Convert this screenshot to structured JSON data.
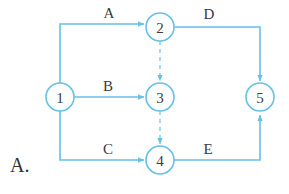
{
  "figure": {
    "caption": "A.",
    "colors": {
      "edge": "#66c0e8",
      "node_stroke": "#66c0e8",
      "node_fill": "#ffffff",
      "text": "#3a3a3a",
      "background": "#ffffff"
    }
  },
  "nodes": [
    {
      "id": "1",
      "label": "1",
      "cx": 60,
      "cy": 97,
      "r": 14
    },
    {
      "id": "2",
      "label": "2",
      "cx": 160,
      "cy": 27,
      "r": 14
    },
    {
      "id": "3",
      "label": "3",
      "cx": 160,
      "cy": 97,
      "r": 14
    },
    {
      "id": "4",
      "label": "4",
      "cx": 160,
      "cy": 160,
      "r": 14
    },
    {
      "id": "5",
      "label": "5",
      "cx": 260,
      "cy": 97,
      "r": 14
    }
  ],
  "edges": [
    {
      "id": "A",
      "label": "A",
      "from": "1",
      "to": "2",
      "style": "solid",
      "label_x": 109,
      "label_y": 18
    },
    {
      "id": "B",
      "label": "B",
      "from": "1",
      "to": "3",
      "style": "solid",
      "label_x": 108,
      "label_y": 88
    },
    {
      "id": "C",
      "label": "C",
      "from": "1",
      "to": "4",
      "style": "solid",
      "label_x": 108,
      "label_y": 152
    },
    {
      "id": "D",
      "label": "D",
      "from": "2",
      "to": "5",
      "style": "solid",
      "label_x": 209,
      "label_y": 19
    },
    {
      "id": "E",
      "label": "E",
      "from": "4",
      "to": "5",
      "style": "solid",
      "label_x": 208,
      "label_y": 152
    },
    {
      "id": "dummy-2-3",
      "label": "",
      "from": "2",
      "to": "3",
      "style": "dashed",
      "label_x": 0,
      "label_y": 0
    },
    {
      "id": "dummy-3-4",
      "label": "",
      "from": "3",
      "to": "4",
      "style": "dashed",
      "label_x": 0,
      "label_y": 0
    }
  ]
}
